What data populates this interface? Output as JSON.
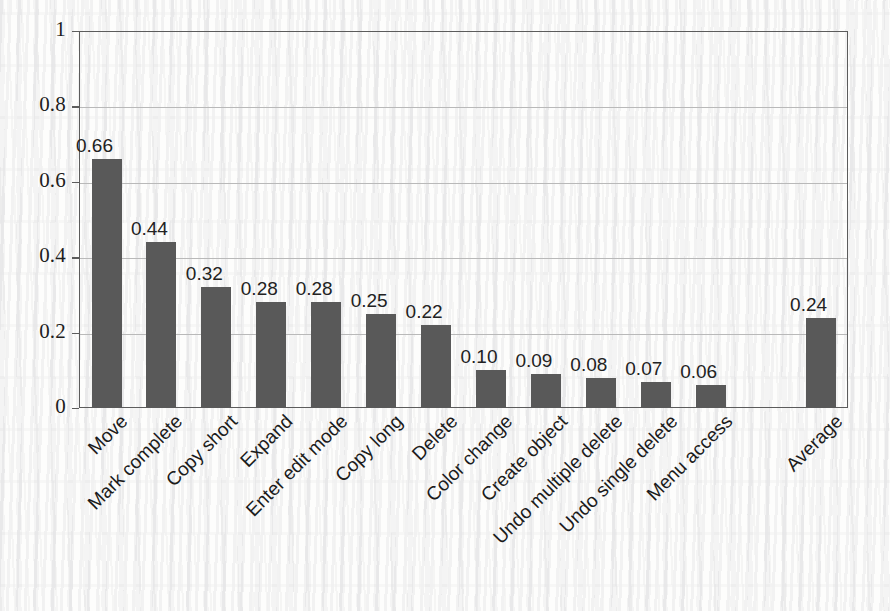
{
  "chart_data": {
    "type": "bar",
    "title": "",
    "subtitle": "",
    "xlabel": "",
    "ylabel": "",
    "ylim": [
      0,
      1
    ],
    "yticks": [
      "0",
      "0.2",
      "0.4",
      "0.6",
      "0.8",
      "1"
    ],
    "ytick_values": [
      0,
      0.2,
      0.4,
      0.6,
      0.8,
      1
    ],
    "grid": "horizontal",
    "legend": "none",
    "bar_color": "#595959",
    "categories": [
      "Move",
      "Mark complete",
      "Copy short",
      "Expand",
      "Enter edit mode",
      "Copy long",
      "Delete",
      "Color change",
      "Create object",
      "Undo multiple delete",
      "Undo single delete",
      "Menu access",
      "Average"
    ],
    "values": [
      0.66,
      0.44,
      0.32,
      0.28,
      0.28,
      0.25,
      0.22,
      0.1,
      0.09,
      0.08,
      0.07,
      0.06,
      0.24
    ],
    "value_labels": [
      "0.66",
      "0.44",
      "0.32",
      "0.28",
      "0.28",
      "0.25",
      "0.22",
      "0.10",
      "0.09",
      "0.08",
      "0.07",
      "0.06",
      "0.24"
    ],
    "slot_index": [
      0,
      1,
      2,
      3,
      4,
      5,
      6,
      7,
      8,
      9,
      10,
      11,
      13
    ],
    "empty_slot_index": [
      12
    ],
    "slot_count": 14
  }
}
